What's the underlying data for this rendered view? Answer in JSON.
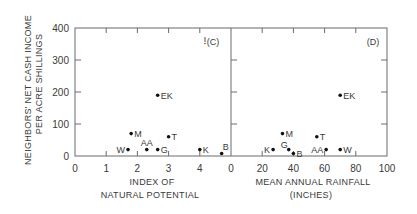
{
  "chart_data": [
    {
      "type": "scatter",
      "panel_label": "(C)",
      "title": "",
      "xlabel": "INDEX OF NATURAL POTENTIAL",
      "xlabel_lines": [
        "INDEX OF",
        "NATURAL POTENTIAL"
      ],
      "ylabel": "NEIGHBORS' NET CASH INCOME PER ACRE SHILLINGS",
      "ylabel_lines": [
        "NEIGHBORS'  NET  CASH  INCOME",
        "PER  ACRE   SHILLINGS"
      ],
      "xlim": [
        0,
        5
      ],
      "ylim": [
        0,
        400
      ],
      "xticks": [
        0,
        1,
        2,
        3,
        4
      ],
      "yticks": [
        0,
        100,
        200,
        300,
        400
      ],
      "grid": false,
      "points": [
        {
          "label": "EK",
          "x": 2.65,
          "y": 190,
          "label_pos": "right"
        },
        {
          "label": "M",
          "x": 1.8,
          "y": 70,
          "label_pos": "right"
        },
        {
          "label": "T",
          "x": 3.0,
          "y": 60,
          "label_pos": "right"
        },
        {
          "label": "W",
          "x": 1.7,
          "y": 20,
          "label_pos": "left"
        },
        {
          "label": "AA",
          "x": 2.3,
          "y": 20,
          "label_pos": "above"
        },
        {
          "label": "G",
          "x": 2.65,
          "y": 20,
          "label_pos": "right"
        },
        {
          "label": "K",
          "x": 4.0,
          "y": 20,
          "label_pos": "right"
        },
        {
          "label": "B",
          "x": 4.7,
          "y": 8,
          "label_pos": "above-right"
        }
      ]
    },
    {
      "type": "scatter",
      "panel_label": "(D)",
      "title": "",
      "xlabel": "MEAN ANNUAL RAINFALL (INCHES)",
      "xlabel_lines": [
        "MEAN  ANNUAL  RAINFALL",
        "(INCHES)"
      ],
      "ylabel": "NEIGHBORS' NET CASH INCOME PER ACRE SHILLINGS",
      "xlim": [
        0,
        100
      ],
      "ylim": [
        0,
        400
      ],
      "xticks": [
        0,
        20,
        40,
        60,
        80,
        100
      ],
      "yticks": [
        0,
        100,
        200,
        300,
        400
      ],
      "grid": false,
      "points": [
        {
          "label": "EK",
          "x": 70,
          "y": 190,
          "label_pos": "right"
        },
        {
          "label": "M",
          "x": 33,
          "y": 70,
          "label_pos": "right"
        },
        {
          "label": "T",
          "x": 55,
          "y": 60,
          "label_pos": "right"
        },
        {
          "label": "K",
          "x": 27,
          "y": 20,
          "label_pos": "left"
        },
        {
          "label": "G",
          "x": 37,
          "y": 20,
          "label_pos": "above-left"
        },
        {
          "label": "B",
          "x": 40,
          "y": 8,
          "label_pos": "right"
        },
        {
          "label": "AA",
          "x": 61,
          "y": 20,
          "label_pos": "left"
        },
        {
          "label": "W",
          "x": 70,
          "y": 20,
          "label_pos": "right"
        }
      ]
    }
  ],
  "colors": {
    "axis": "#6a6a6a",
    "text": "#3a3a3a",
    "marker": "#111111",
    "background": "#ffffff"
  }
}
